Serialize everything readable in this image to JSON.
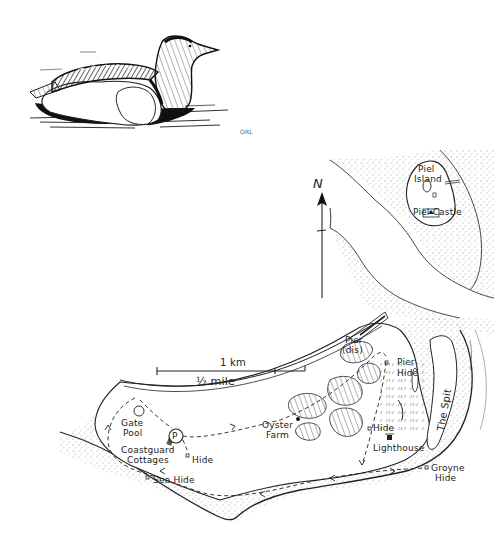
{
  "illustration": {
    "subject": "Eider duck on water",
    "artist_initials": "ORL"
  },
  "map": {
    "north_label": "N",
    "scale": {
      "km_label": "1 km",
      "mile_label": "½ mile"
    },
    "labels": {
      "piel_island": "Piel\nIsland",
      "piel_island_l1": "Piel",
      "piel_island_l2": "Island",
      "piel_castle": "Piel Castle",
      "pier_l1": "Pier",
      "pier_l2": "(dis)",
      "pier_hide_l1": "Pier",
      "pier_hide_l2": "Hide",
      "the_spit": "The Spit",
      "gate_pool_l1": "Gate",
      "gate_pool_l2": "Pool",
      "parking": "P",
      "coastguard_l1": "Coastguard",
      "coastguard_l2": "Cottages",
      "hide_west": "Hide",
      "sea_hide": "Sea Hide",
      "oyster_farm_l1": "Oyster",
      "oyster_farm_l2": "Farm",
      "hide_central": "Hide",
      "lighthouse": "Lighthouse",
      "groyne_hide_l1": "Groyne",
      "groyne_hide_l2": "Hide"
    },
    "colors": {
      "ink": "#222222",
      "stipple": "#9a9a9a",
      "paper": "#ffffff"
    }
  }
}
